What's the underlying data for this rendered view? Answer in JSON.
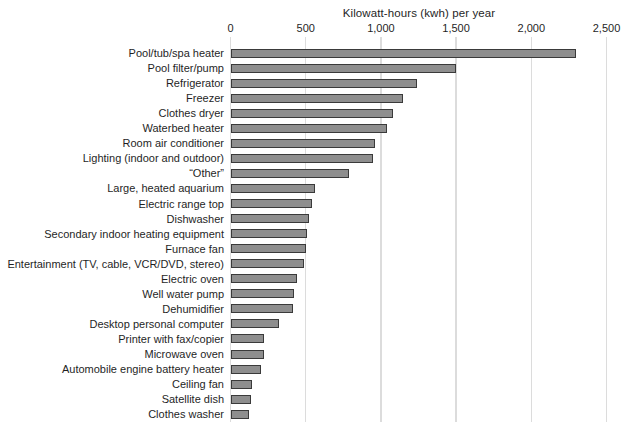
{
  "chart_data": {
    "type": "bar",
    "orientation": "horizontal",
    "title": "Kilowatt-hours (kwh) per year",
    "xlabel": "Kilowatt-hours (kwh) per year",
    "ylabel": "",
    "xlim": [
      0,
      2500
    ],
    "grid": true,
    "legend": "none",
    "tick_values": [
      0,
      500,
      1000,
      1500,
      2000,
      2500
    ],
    "tick_labels": [
      "0",
      "500",
      "1,000",
      "1,500",
      "2,000",
      "2,500"
    ],
    "categories": [
      "Pool/tub/spa heater",
      "Pool filter/pump",
      "Refrigerator",
      "Freezer",
      "Clothes dryer",
      "Waterbed heater",
      "Room air conditioner",
      "Lighting (indoor and outdoor)",
      "“Other”",
      "Large, heated aquarium",
      "Electric range top",
      "Dishwasher",
      "Secondary indoor heating equipment",
      "Furnace fan",
      "Entertainment (TV, cable, VCR/DVD, stereo)",
      "Electric oven",
      "Well water pump",
      "Dehumidifier",
      "Desktop personal computer",
      "Printer with fax/copier",
      "Microwave oven",
      "Automobile engine battery heater",
      "Ceiling fan",
      "Satellite dish",
      "Clothes washer"
    ],
    "values": [
      2300,
      1500,
      1240,
      1150,
      1080,
      1040,
      960,
      945,
      785,
      560,
      540,
      520,
      510,
      505,
      490,
      445,
      420,
      415,
      325,
      225,
      220,
      205,
      145,
      135,
      125
    ],
    "colors": {
      "bar_fill": "#8e8e8e",
      "bar_border": "#3a3a3a",
      "gridline": "#dcdcdc",
      "text": "#1f1f1f",
      "background": "#ffffff"
    }
  }
}
